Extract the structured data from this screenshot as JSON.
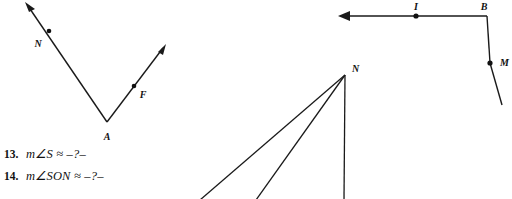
{
  "page": {
    "background_color": "#ffffff",
    "ink_color": "#1a1a1a"
  },
  "figures": [
    {
      "id": "angle-naf",
      "name": "angle-NAF-figure",
      "description": "V-shaped angle with vertex A and two rays with arrowheads passing through labeled points N and F",
      "vertex_label": "A",
      "ray_point_labels": [
        "N",
        "F"
      ],
      "labels": {
        "vertex": "A",
        "left_ray_point": "N",
        "right_ray_point": "F"
      }
    },
    {
      "id": "rays-from-n",
      "name": "three-rays-from-N-figure",
      "description": "Three rays emanating downward from vertex N, two diagonal and one vertical, extending past the bottom edge",
      "vertex_label": "N",
      "ray_count": 3
    },
    {
      "id": "path-ibm",
      "name": "path-I-B-M-figure",
      "description": "Horizontal ray with left arrowhead through point I, turning at corner B and descending through point M",
      "labels": {
        "ray_point": "I",
        "corner": "B",
        "segment_point": "M"
      }
    }
  ],
  "exercises": [
    {
      "number": "13.",
      "text": "m∠S ≈ –?–"
    },
    {
      "number": "14.",
      "text": "m∠SON ≈ –?–"
    }
  ]
}
